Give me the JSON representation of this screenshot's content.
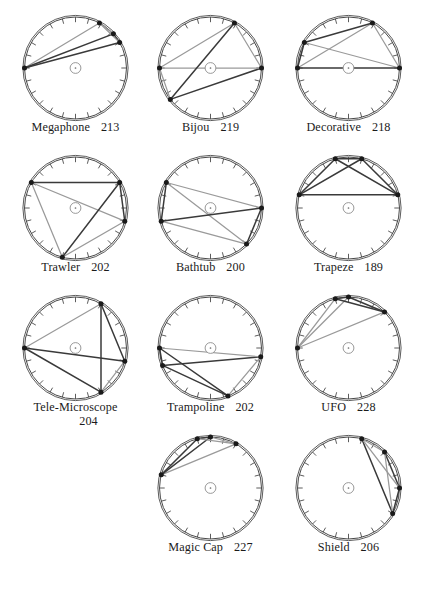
{
  "figure": {
    "columns": 3,
    "tick_count": 24,
    "circle_stroke": "#4a4a4a",
    "chord_dark": "#3a3a3a",
    "chord_light": "#9a9a9a",
    "vertex_color": "#1a1a1a",
    "center_marker": "small-circle-with-dot"
  },
  "items": [
    {
      "name": "Megaphone",
      "number": "213",
      "row": 0,
      "col": 0,
      "vertices": [
        180,
        62,
        42,
        30
      ],
      "edges": [
        {
          "a": 0,
          "b": 1,
          "tone": "light"
        },
        {
          "a": 1,
          "b": 2,
          "tone": "light"
        },
        {
          "a": 2,
          "b": 3,
          "tone": "dark"
        },
        {
          "a": 3,
          "b": 0,
          "tone": "dark"
        },
        {
          "a": 0,
          "b": 2,
          "tone": "dark"
        },
        {
          "a": 1,
          "b": 3,
          "tone": "light"
        }
      ]
    },
    {
      "name": "Bijou",
      "number": "219",
      "row": 0,
      "col": 1,
      "vertices": [
        180,
        62,
        0,
        218
      ],
      "edges": [
        {
          "a": 0,
          "b": 1,
          "tone": "light"
        },
        {
          "a": 1,
          "b": 2,
          "tone": "light"
        },
        {
          "a": 2,
          "b": 3,
          "tone": "dark"
        },
        {
          "a": 3,
          "b": 0,
          "tone": "light"
        },
        {
          "a": 0,
          "b": 2,
          "tone": "light"
        },
        {
          "a": 1,
          "b": 3,
          "tone": "dark"
        }
      ]
    },
    {
      "name": "Decorative",
      "number": "218",
      "row": 0,
      "col": 2,
      "vertices": [
        180,
        62,
        150,
        0
      ],
      "edges": [
        {
          "a": 0,
          "b": 1,
          "tone": "light"
        },
        {
          "a": 1,
          "b": 2,
          "tone": "dark"
        },
        {
          "a": 2,
          "b": 3,
          "tone": "light"
        },
        {
          "a": 3,
          "b": 0,
          "tone": "dark"
        },
        {
          "a": 0,
          "b": 2,
          "tone": "dark"
        },
        {
          "a": 1,
          "b": 3,
          "tone": "light"
        }
      ]
    },
    {
      "name": "Trawler",
      "number": "202",
      "row": 1,
      "col": 0,
      "vertices": [
        150,
        30,
        345,
        255
      ],
      "edges": [
        {
          "a": 0,
          "b": 1,
          "tone": "dark"
        },
        {
          "a": 1,
          "b": 2,
          "tone": "dark"
        },
        {
          "a": 2,
          "b": 3,
          "tone": "light"
        },
        {
          "a": 3,
          "b": 0,
          "tone": "light"
        },
        {
          "a": 0,
          "b": 2,
          "tone": "light"
        },
        {
          "a": 1,
          "b": 3,
          "tone": "dark"
        }
      ]
    },
    {
      "name": "Bathtub",
      "number": "200",
      "row": 1,
      "col": 1,
      "vertices": [
        150,
        195,
        315,
        0
      ],
      "edges": [
        {
          "a": 0,
          "b": 1,
          "tone": "dark"
        },
        {
          "a": 1,
          "b": 2,
          "tone": "light"
        },
        {
          "a": 2,
          "b": 3,
          "tone": "dark"
        },
        {
          "a": 3,
          "b": 0,
          "tone": "light"
        },
        {
          "a": 0,
          "b": 2,
          "tone": "light"
        },
        {
          "a": 1,
          "b": 3,
          "tone": "dark"
        }
      ]
    },
    {
      "name": "Trapeze",
      "number": "189",
      "row": 1,
      "col": 2,
      "vertices": [
        105,
        75,
        15,
        165
      ],
      "edges": [
        {
          "a": 0,
          "b": 1,
          "tone": "dark"
        },
        {
          "a": 1,
          "b": 2,
          "tone": "dark"
        },
        {
          "a": 2,
          "b": 3,
          "tone": "dark"
        },
        {
          "a": 3,
          "b": 0,
          "tone": "dark"
        },
        {
          "a": 0,
          "b": 2,
          "tone": "dark"
        },
        {
          "a": 1,
          "b": 3,
          "tone": "dark"
        }
      ]
    },
    {
      "name": "Tele-Microscope",
      "number": "204",
      "row": 2,
      "col": 0,
      "wrap": true,
      "vertices": [
        60,
        180,
        345,
        300
      ],
      "edges": [
        {
          "a": 0,
          "b": 1,
          "tone": "light"
        },
        {
          "a": 1,
          "b": 2,
          "tone": "dark"
        },
        {
          "a": 2,
          "b": 3,
          "tone": "light"
        },
        {
          "a": 3,
          "b": 0,
          "tone": "dark"
        },
        {
          "a": 0,
          "b": 2,
          "tone": "dark"
        },
        {
          "a": 1,
          "b": 3,
          "tone": "dark"
        }
      ]
    },
    {
      "name": "Trampoline",
      "number": "202",
      "row": 2,
      "col": 1,
      "vertices": [
        180,
        200,
        350,
        290
      ],
      "edges": [
        {
          "a": 0,
          "b": 1,
          "tone": "dark"
        },
        {
          "a": 1,
          "b": 2,
          "tone": "dark"
        },
        {
          "a": 2,
          "b": 3,
          "tone": "light"
        },
        {
          "a": 3,
          "b": 0,
          "tone": "dark"
        },
        {
          "a": 0,
          "b": 2,
          "tone": "light"
        },
        {
          "a": 1,
          "b": 3,
          "tone": "dark"
        }
      ]
    },
    {
      "name": "UFO",
      "number": "228",
      "row": 2,
      "col": 2,
      "vertices": [
        180,
        105,
        90,
        45
      ],
      "edges": [
        {
          "a": 0,
          "b": 1,
          "tone": "light"
        },
        {
          "a": 1,
          "b": 2,
          "tone": "dark"
        },
        {
          "a": 2,
          "b": 3,
          "tone": "dark"
        },
        {
          "a": 3,
          "b": 0,
          "tone": "light"
        },
        {
          "a": 0,
          "b": 2,
          "tone": "light"
        },
        {
          "a": 1,
          "b": 3,
          "tone": "dark"
        }
      ]
    },
    {
      "name": "Magic Cap",
      "number": "227",
      "row": 3,
      "col": 1,
      "vertices": [
        165,
        105,
        90,
        60
      ],
      "edges": [
        {
          "a": 0,
          "b": 1,
          "tone": "dark"
        },
        {
          "a": 1,
          "b": 2,
          "tone": "dark"
        },
        {
          "a": 2,
          "b": 3,
          "tone": "light"
        },
        {
          "a": 3,
          "b": 0,
          "tone": "light"
        },
        {
          "a": 0,
          "b": 2,
          "tone": "dark"
        },
        {
          "a": 1,
          "b": 3,
          "tone": "light"
        }
      ]
    },
    {
      "name": "Shield",
      "number": "206",
      "row": 3,
      "col": 2,
      "vertices": [
        75,
        45,
        0,
        330
      ],
      "edges": [
        {
          "a": 0,
          "b": 1,
          "tone": "light"
        },
        {
          "a": 1,
          "b": 2,
          "tone": "dark"
        },
        {
          "a": 2,
          "b": 3,
          "tone": "dark"
        },
        {
          "a": 3,
          "b": 0,
          "tone": "dark"
        },
        {
          "a": 0,
          "b": 2,
          "tone": "light"
        },
        {
          "a": 1,
          "b": 3,
          "tone": "light"
        }
      ]
    }
  ]
}
